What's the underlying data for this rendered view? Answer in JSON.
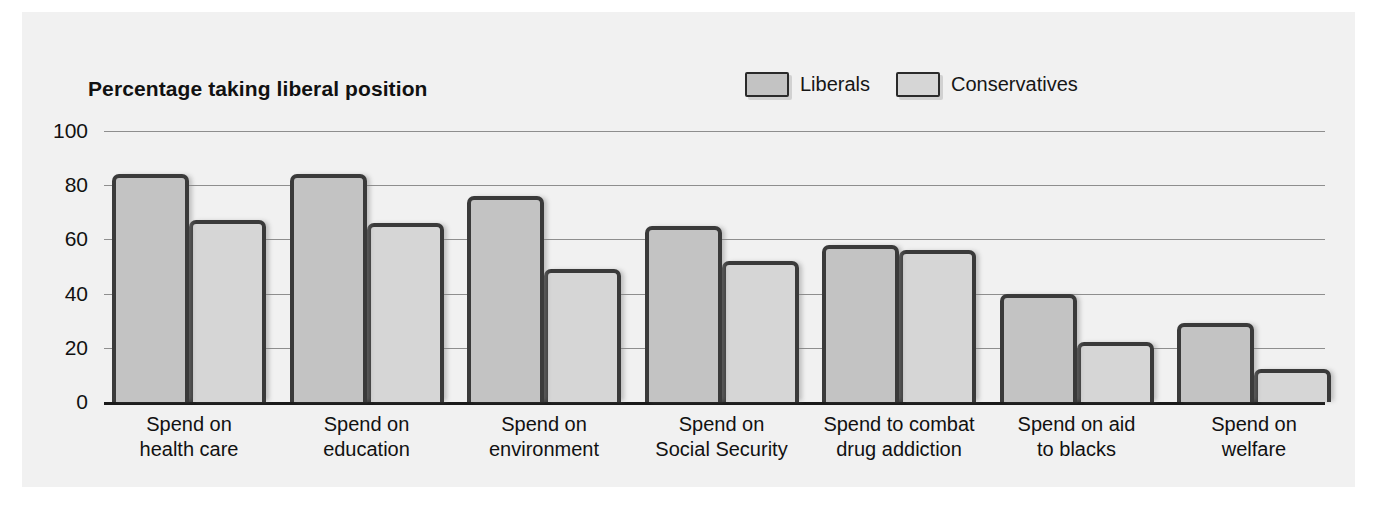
{
  "chart_data": {
    "type": "bar",
    "title": "Percentage taking liberal position",
    "xlabel": "",
    "ylabel": "",
    "ylim": [
      0,
      100
    ],
    "yticks": [
      0,
      20,
      40,
      60,
      80,
      100
    ],
    "grid": true,
    "legend_position": "top-right",
    "categories": [
      "Spend on health care",
      "Spend on education",
      "Spend on environment",
      "Spend on Social Security",
      "Spend to combat drug addiction",
      "Spend on aid to blacks",
      "Spend on welfare"
    ],
    "category_lines": [
      [
        "Spend on",
        "health care"
      ],
      [
        "Spend on",
        "education"
      ],
      [
        "Spend on",
        "environment"
      ],
      [
        "Spend on",
        "Social Security"
      ],
      [
        "Spend to combat",
        "drug addiction"
      ],
      [
        "Spend on aid",
        "to blacks"
      ],
      [
        "Spend on",
        "welfare"
      ]
    ],
    "series": [
      {
        "name": "Liberals",
        "color": "#c3c3c3",
        "values": [
          84,
          84,
          76,
          65,
          58,
          40,
          29
        ]
      },
      {
        "name": "Conservatives",
        "color": "#d6d6d6",
        "values": [
          67,
          66,
          49,
          52,
          56,
          22,
          12
        ]
      }
    ]
  },
  "legend": {
    "entries": [
      {
        "label": "Liberals"
      },
      {
        "label": "Conservatives"
      }
    ]
  },
  "colors": {
    "background": "#ffffff",
    "panel": "#f1f1f1",
    "bar_outline": "#3a3a3a",
    "gridline": "#8e8e8e",
    "axis": "#1a1a1a",
    "text": "#111111"
  }
}
